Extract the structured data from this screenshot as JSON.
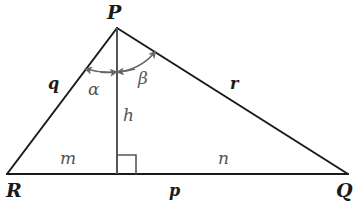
{
  "diagram": {
    "vertices": [
      {
        "name": "P",
        "x": 117,
        "y": 28
      },
      {
        "name": "R",
        "x": 7,
        "y": 174
      },
      {
        "name": "Q",
        "x": 348,
        "y": 174
      }
    ],
    "altitude_foot": {
      "x": 117,
      "y": 174
    },
    "labels": {
      "vertex_p": "P",
      "vertex_r": "R",
      "vertex_q": "Q",
      "side_q": "q",
      "side_r": "r",
      "side_p": "p",
      "segment_m": "m",
      "segment_n": "n",
      "altitude_h": "h",
      "angle_alpha": "α",
      "angle_beta": "β"
    },
    "colors": {
      "edge": "#1a1a1a",
      "altitude": "#555555",
      "arc": "#666666",
      "background": "#ffffff"
    }
  }
}
